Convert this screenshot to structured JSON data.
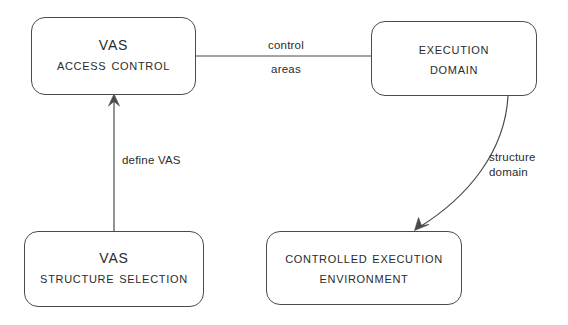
{
  "diagram": {
    "background_color": "#ffffff",
    "stroke_color": "#4a4a4a",
    "text_color": "#2b2b2b",
    "nodes": [
      {
        "id": "vas-access-control",
        "line1": "VAS",
        "line2": "Access Control",
        "shape": "rounded-rectangle"
      },
      {
        "id": "execution-domain",
        "line1": "Execution",
        "line2": "Domain",
        "shape": "rounded-rectangle"
      },
      {
        "id": "vas-structure-selection",
        "line1": "VAS",
        "line2": "Structure Selection",
        "shape": "rounded-rectangle"
      },
      {
        "id": "controlled-execution-environment",
        "line1": "Controlled Execution",
        "line2": "Environment",
        "shape": "rounded-rectangle"
      }
    ],
    "edges": [
      {
        "id": "control-areas",
        "from": "execution-domain",
        "to": "vas-access-control",
        "style": "straight-line",
        "arrowhead": "none",
        "label_line1": "control",
        "label_line2": "areas"
      },
      {
        "id": "define-vas",
        "from": "vas-structure-selection",
        "to": "vas-access-control",
        "style": "straight-line",
        "arrowhead": "up",
        "label_line1": "define VAS",
        "label_line2": ""
      },
      {
        "id": "structure-domain",
        "from": "execution-domain",
        "to": "controlled-execution-environment",
        "style": "curved-line",
        "arrowhead": "down-left",
        "label_line1": "structure",
        "label_line2": "domain"
      }
    ]
  }
}
